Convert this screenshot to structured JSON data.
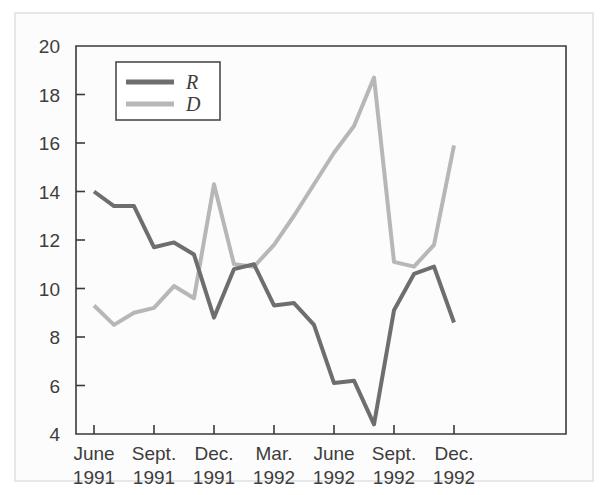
{
  "chart_data": {
    "type": "line",
    "title": "",
    "xlabel": "",
    "ylabel": "",
    "ylim": [
      4,
      20
    ],
    "y_ticks": [
      4,
      6,
      8,
      10,
      12,
      14,
      16,
      18,
      20
    ],
    "grid": false,
    "legend_position": "top-left",
    "x_tick_labels": [
      {
        "line1": "June",
        "line2": "1991"
      },
      {
        "line1": "Sept.",
        "line2": "1991"
      },
      {
        "line1": "Dec.",
        "line2": "1991"
      },
      {
        "line1": "Mar.",
        "line2": "1992"
      },
      {
        "line1": "June",
        "line2": "1992"
      },
      {
        "line1": "Sept.",
        "line2": "1992"
      },
      {
        "line1": "Dec.",
        "line2": "1992"
      }
    ],
    "x": [
      "June 1991",
      "July 1991",
      "Aug. 1991",
      "Sept. 1991",
      "Oct. 1991",
      "Nov. 1991",
      "Dec. 1991",
      "Jan. 1992",
      "Feb. 1992",
      "Mar. 1992",
      "Apr. 1992",
      "May 1992",
      "June 1992",
      "July 1992",
      "Aug. 1992",
      "Sept. 1992",
      "Oct. 1992",
      "Nov. 1992",
      "Dec. 1992"
    ],
    "series": [
      {
        "name": "R",
        "color": "#6e6e6e",
        "values": [
          14.0,
          13.4,
          13.4,
          11.7,
          11.9,
          11.4,
          8.8,
          10.8,
          11.0,
          9.3,
          9.4,
          8.5,
          6.1,
          6.2,
          4.4,
          9.1,
          10.6,
          10.9,
          8.6
        ]
      },
      {
        "name": "D",
        "color": "#b7b7b7",
        "values": [
          9.3,
          8.5,
          9.0,
          9.2,
          10.1,
          9.6,
          14.3,
          11.0,
          10.9,
          11.8,
          13.0,
          14.3,
          15.6,
          16.7,
          18.7,
          11.1,
          10.9,
          11.8,
          15.9
        ]
      }
    ],
    "legend": [
      {
        "label": "R",
        "color": "#6e6e6e"
      },
      {
        "label": "D",
        "color": "#b7b7b7"
      }
    ]
  },
  "colors": {
    "series_r": "#6e6e6e",
    "series_d": "#b7b7b7",
    "axis": "#3a3a3a",
    "text": "#3d3d3d",
    "frame": "#e7e7e7",
    "background": "#fcfcfc"
  }
}
